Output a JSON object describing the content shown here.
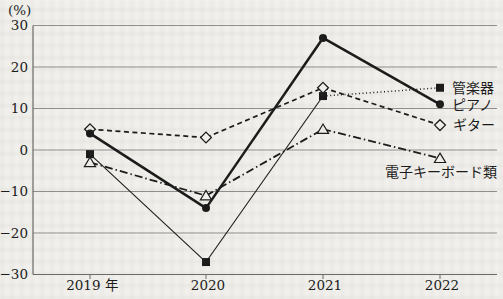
{
  "page": {
    "background_color": "#f1f0ec",
    "ink_color": "#1a1a1a",
    "grid_color": "#8f8f8f",
    "axis_color": "#6b6b6b"
  },
  "chart_data": {
    "type": "line",
    "unit_label": "(%)",
    "categories": [
      "2019 年",
      "2020",
      "2021",
      "2022"
    ],
    "ylim": [
      -30,
      30
    ],
    "ytick_values": [
      30,
      20,
      10,
      0,
      -10,
      -20,
      -30
    ],
    "ytick_labels": [
      "30",
      "20",
      "10",
      "0",
      "−10",
      "−20",
      "−30"
    ],
    "grid": "horizontal",
    "legend_position": "labels-at-line-ends-right",
    "series": [
      {
        "name": "管楽器",
        "values": [
          -1,
          -27,
          13,
          15
        ],
        "marker": "filled-square",
        "line_style": "thin-solid",
        "line_style_segments": [
          "thin-solid",
          "thin-solid",
          "dotted"
        ],
        "color": "#1a1a1a"
      },
      {
        "name": "ピアノ",
        "values": [
          4,
          -14,
          27,
          11
        ],
        "marker": "filled-circle",
        "line_style": "thick-solid",
        "color": "#1a1a1a"
      },
      {
        "name": "ギター",
        "values": [
          5,
          3,
          15,
          6
        ],
        "marker": "open-diamond",
        "line_style": "dashed",
        "color": "#1a1a1a"
      },
      {
        "name": "電子キーボード類",
        "values": [
          -3,
          -11,
          5,
          -2
        ],
        "marker": "open-triangle",
        "line_style": "dash-dot",
        "color": "#1a1a1a"
      }
    ]
  }
}
